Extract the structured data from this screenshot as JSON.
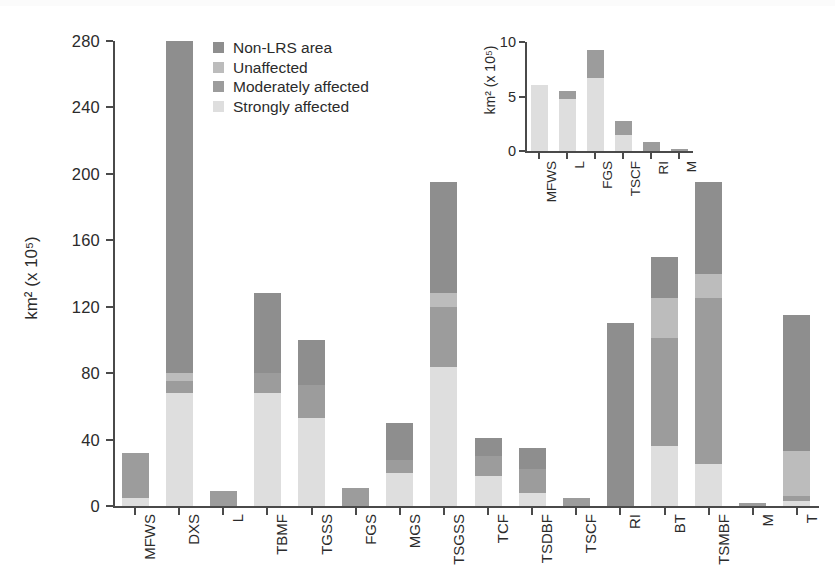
{
  "chart_data": {
    "type": "bar",
    "title": "",
    "subtitle": "",
    "xlabel": "",
    "ylabel": "km² (x 10⁵)",
    "ylabel_main": "km²",
    "ylabel_exp": "(x 10⁵)",
    "ylim": [
      0,
      280
    ],
    "yticks": [
      0,
      40,
      80,
      120,
      160,
      200,
      240,
      280
    ],
    "grid": false,
    "stacked": true,
    "legend_position": "top-center-inside",
    "categories": [
      "MFWS",
      "DXS",
      "L",
      "TBMF",
      "TGSS",
      "FGS",
      "MGS",
      "TSGSS",
      "TCF",
      "TSDBF",
      "TSCF",
      "RI",
      "BT",
      "TSMBF",
      "M",
      "T"
    ],
    "series": [
      {
        "name": "Strongly affected",
        "color": "#dedede",
        "values": [
          5,
          68,
          0,
          68,
          53,
          0,
          20,
          84,
          18,
          8,
          0,
          0,
          36,
          25,
          0,
          3
        ]
      },
      {
        "name": "Moderately affected",
        "color": "#9c9c9c",
        "values": [
          27,
          7,
          9,
          12,
          20,
          11,
          8,
          36,
          12,
          14,
          5,
          0,
          65,
          100,
          2,
          3
        ]
      },
      {
        "name": "Unaffected",
        "color": "#bcbcbc",
        "values": [
          0,
          5,
          0,
          0,
          0,
          0,
          0,
          8,
          0,
          0,
          0,
          0,
          24,
          15,
          0,
          27
        ]
      },
      {
        "name": "Non-LRS area",
        "color": "#8e8e8e",
        "values": [
          0,
          200,
          0,
          48,
          27,
          0,
          22,
          67,
          11,
          13,
          0,
          110,
          25,
          55,
          0,
          82
        ]
      }
    ],
    "totals": [
      32,
      280,
      9,
      128,
      100,
      11,
      50,
      195,
      41,
      35,
      5,
      110,
      150,
      195,
      2,
      115
    ],
    "inset": {
      "type": "bar",
      "stacked": true,
      "ylabel": "km² (x 10⁵)",
      "ylabel_main": "km²",
      "ylabel_exp": "(x 10⁵)",
      "ylim": [
        0,
        10
      ],
      "yticks": [
        0,
        5,
        10
      ],
      "categories": [
        "MFWS",
        "L",
        "FGS",
        "TSCF",
        "RI",
        "M"
      ],
      "series": [
        {
          "name": "Strongly affected",
          "color": "#dedede",
          "values": [
            6.1,
            4.8,
            6.7,
            1.5,
            0,
            0
          ]
        },
        {
          "name": "Moderately affected",
          "color": "#9c9c9c",
          "values": [
            0,
            0.7,
            2.6,
            1.3,
            0.8,
            0.2
          ]
        }
      ],
      "totals": [
        6.1,
        5.5,
        9.3,
        2.8,
        0.8,
        0.2
      ]
    }
  },
  "legend": {
    "items": [
      {
        "label": "Non-LRS area",
        "color": "#8e8e8e"
      },
      {
        "label": "Unaffected",
        "color": "#bcbcbc"
      },
      {
        "label": "Moderately affected",
        "color": "#9c9c9c"
      },
      {
        "label": "Strongly affected",
        "color": "#dedede"
      }
    ]
  }
}
